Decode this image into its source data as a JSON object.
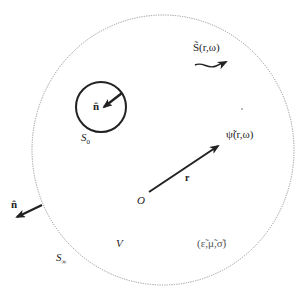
{
  "diagram": {
    "type": "electromagnetic scattering geometry",
    "outer_boundary": {
      "label": "S",
      "subscript": "∞",
      "style": "dotted"
    },
    "inner_boundary": {
      "label": "S",
      "subscript": "0",
      "style": "solid"
    },
    "volume_label": "V",
    "origin_label": "O",
    "position_vector_label": "r",
    "normal_inner_label": "n̂",
    "normal_outer_label": "n̂",
    "source_label": "S̃(r,ω)",
    "field_label": "ψ̃(r,ω)",
    "medium_label": "(ε̃,μ̃,σ̃)",
    "colors": {
      "stroke": "#222222",
      "dotted": "#8a8a8a",
      "background": "#ffffff"
    }
  }
}
